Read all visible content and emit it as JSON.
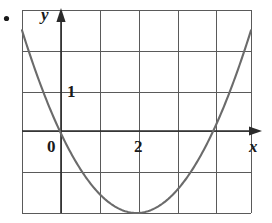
{
  "figure": {
    "bullet_marker": "•",
    "axis_labels": {
      "x": "x",
      "y": "y"
    },
    "tick_labels": {
      "origin": "0",
      "x_two": "2",
      "y_one": "1"
    },
    "colors": {
      "grid": "#5a5a5a",
      "axis": "#2b2b2b",
      "curve": "#6b6b6b",
      "background": "#ffffff",
      "text": "#1a1a1a"
    }
  },
  "chart_data": {
    "type": "line",
    "title": "",
    "subtitle": "",
    "xlabel": "x",
    "ylabel": "y",
    "xlim": [
      -1,
      5
    ],
    "ylim": [
      -2,
      3
    ],
    "grid": true,
    "legend": false,
    "legend_position": "none",
    "x_ticks": [
      -1,
      0,
      1,
      2,
      3,
      4,
      5
    ],
    "y_ticks": [
      -2,
      -1,
      0,
      1,
      2,
      3
    ],
    "x_tick_labels_shown": [
      "0",
      "2"
    ],
    "y_tick_labels_shown": [
      "1"
    ],
    "annotations": [
      {
        "text": "0",
        "x": 0,
        "y": 0,
        "role": "origin-label"
      },
      {
        "text": "2",
        "x": 2,
        "y": 0,
        "role": "x-tick-label"
      },
      {
        "text": "1",
        "x": 0,
        "y": 1,
        "role": "y-tick-label"
      },
      {
        "text": "x",
        "x": 5,
        "y": 0,
        "role": "x-axis-label"
      },
      {
        "text": "y",
        "x": 0,
        "y": 3,
        "role": "y-axis-label"
      }
    ],
    "series": [
      {
        "name": "parabola",
        "equation": "y = x^2 - 4x",
        "roots": [
          0,
          4
        ],
        "vertex": [
          2,
          -2
        ],
        "x": [
          -0.6,
          -0.4,
          -0.2,
          0,
          0.4,
          0.8,
          1.2,
          1.6,
          2,
          2.4,
          2.8,
          3.2,
          3.6,
          4,
          4.4,
          4.8,
          5
        ],
        "values": [
          2.76,
          1.76,
          0.84,
          0,
          -1.44,
          -2.56,
          -3.36,
          -3.84,
          -4,
          -3.84,
          -3.36,
          -2.56,
          -1.44,
          0,
          1.76,
          3.84,
          5
        ]
      }
    ]
  }
}
